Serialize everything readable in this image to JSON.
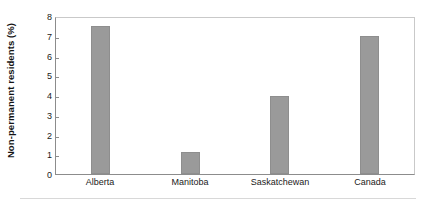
{
  "chart_data": {
    "type": "bar",
    "title": "",
    "subtitle": "",
    "xlabel": "",
    "ylabel": "Non-permanent residents (%)",
    "categories": [
      "Alberta",
      "Manitoba",
      "Saskatchewan",
      "Canada"
    ],
    "values": [
      7.5,
      1.1,
      3.95,
      7.0
    ],
    "ylim": [
      0,
      8
    ],
    "ytick_labels": [
      "8",
      "7",
      "6",
      "5",
      "4",
      "3",
      "2",
      "1",
      "0"
    ],
    "ytick_values": [
      8,
      7,
      6,
      5,
      4,
      3,
      2,
      1,
      0
    ],
    "ytick_step": 1,
    "grid": false,
    "legend": false,
    "legend_position": "none",
    "bar_color": "#9a9a9a",
    "bar_edge_color": "#8e8e8e",
    "axis_color": "#8c8c8c",
    "plot_border_color": "#c9c9c9",
    "text_color": "#1a1a1a"
  }
}
